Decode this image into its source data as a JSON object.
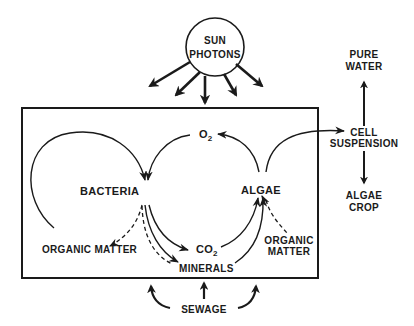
{
  "diagram": {
    "type": "process-flow",
    "sun": {
      "line1": "SUN",
      "line2": "PHOTONS"
    },
    "nodes": {
      "bacteria": "BACTERIA",
      "algae": "ALGAE",
      "o2": {
        "base": "O",
        "sub": "2"
      },
      "co2": {
        "base": "CO",
        "sub": "2"
      },
      "minerals": "MINERALS",
      "organic_matter_left": "ORGANIC MATTER",
      "organic_matter_right": {
        "line1": "ORGANIC",
        "line2": "MATTER"
      },
      "cell_suspension": {
        "line1": "CELL",
        "line2": "SUSPENSION"
      },
      "pure_water": {
        "line1": "PURE",
        "line2": "WATER"
      },
      "algae_crop": {
        "line1": "ALGAE",
        "line2": "CROP"
      },
      "sewage": "SEWAGE"
    },
    "edges": [
      {
        "from": "organic_matter_left",
        "to": "bacteria",
        "style": "solid"
      },
      {
        "from": "o2",
        "to": "bacteria",
        "style": "solid"
      },
      {
        "from": "algae",
        "to": "o2",
        "style": "solid"
      },
      {
        "from": "algae",
        "to": "cell_suspension",
        "style": "solid"
      },
      {
        "from": "bacteria",
        "to": "organic_matter_left",
        "style": "dashed"
      },
      {
        "from": "bacteria",
        "to": "co2",
        "style": "solid"
      },
      {
        "from": "bacteria",
        "to": "minerals",
        "style": "solid+dashed"
      },
      {
        "from": "co2",
        "to": "algae",
        "style": "solid"
      },
      {
        "from": "minerals",
        "to": "algae",
        "style": "solid"
      },
      {
        "from": "algae",
        "to": "organic_matter_right",
        "style": "dashed"
      },
      {
        "from": "cell_suspension",
        "to": "pure_water",
        "style": "solid"
      },
      {
        "from": "cell_suspension",
        "to": "algae_crop",
        "style": "solid"
      },
      {
        "from": "sewage",
        "to": "system",
        "style": "solid"
      },
      {
        "from": "sun",
        "to": "system",
        "style": "solid"
      }
    ]
  }
}
